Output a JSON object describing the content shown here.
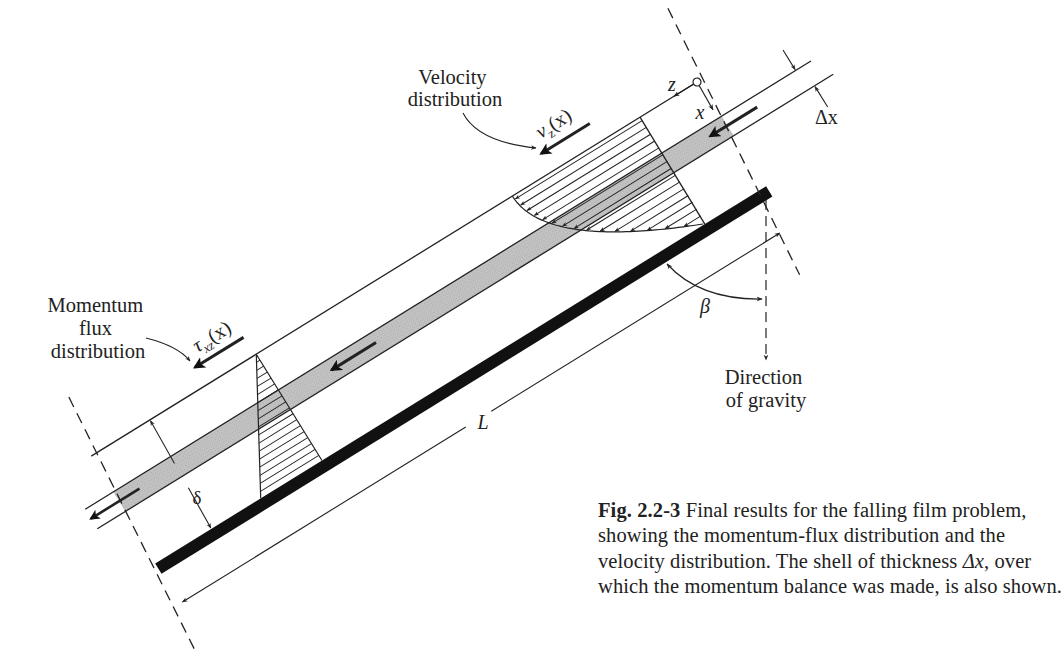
{
  "figure": {
    "colors": {
      "ink": "#222222",
      "plate": "#111111",
      "shell_fill": "#bdbdbd",
      "background": "#ffffff"
    },
    "geometry": {
      "film_angle_deg": 31.7,
      "film_thickness_px": 125,
      "shell_top_depth_px": 42,
      "shell_bottom_depth_px": 65,
      "plate_length_px": 712
    },
    "labels": {
      "velocity_title_line1": "Velocity",
      "velocity_title_line2": "distribution",
      "velocity_symbol_main": "v",
      "velocity_symbol_sub": "z",
      "velocity_symbol_arg": "(x)",
      "momentum_title_line1": "Momentum",
      "momentum_title_line2": "flux",
      "momentum_title_line3": "distribution",
      "tau_symbol_main": "τ",
      "tau_symbol_sub": "xz",
      "tau_symbol_arg": "(x)",
      "axis_z": "z",
      "axis_x": "x",
      "delta_x": "Δx",
      "delta": "δ",
      "length": "L",
      "beta": "β",
      "gravity_line1": "Direction",
      "gravity_line2": "of gravity"
    },
    "caption": {
      "fig_number": "Fig. 2.2-3",
      "line1": " Final results for the falling film problem,",
      "line2": "showing the momentum-flux distribution and the",
      "line3_pre": "velocity distribution. The shell of thickness ",
      "line3_sym": "Δx",
      "line3_post": ", over",
      "line4": "which the momentum balance was made, is also shown."
    },
    "icons": {
      "origin": "origin-circle-icon",
      "flow_arrow": "flow-arrow-icon",
      "dimension_arrow": "dimension-arrow-icon"
    }
  }
}
